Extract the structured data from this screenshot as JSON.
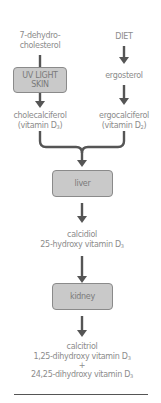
{
  "diagram": {
    "left_source": {
      "line1": "7-dehydro-",
      "line2": "cholesterol"
    },
    "right_source": {
      "label": "DIET"
    },
    "uv_box": {
      "line1": "UV LIGHT",
      "line2": "SKIN"
    },
    "ergosterol": {
      "label": "ergosterol"
    },
    "cholecalciferol": {
      "name": "cholecalciferol",
      "sub_prefix": "(vitamin D",
      "sub_number": "3",
      "suffix": ")"
    },
    "ergocalciferol": {
      "name": "ergocalciferol",
      "sub_prefix": "(vitamin D",
      "sub_number": "2",
      "suffix": ")"
    },
    "liver_box": {
      "label": "liver"
    },
    "calcidiol": {
      "name": "calcidiol",
      "full_prefix": "25-hydroxy vitamin D",
      "full_sub": "3"
    },
    "kidney_box": {
      "label": "kidney"
    },
    "calcitriol": {
      "name": "calcitriol",
      "line2_prefix": "1,25-dihydroxy vitamin D",
      "line2_sub": "3",
      "plus": "+",
      "line3_prefix": "24,25-dihydroxy vitamin D",
      "line3_sub": "3"
    },
    "colors": {
      "box_fill": "#c9c9c9",
      "box_border": "#8a8a8a",
      "arrow": "#555555",
      "text": "#8c8c8c"
    }
  }
}
